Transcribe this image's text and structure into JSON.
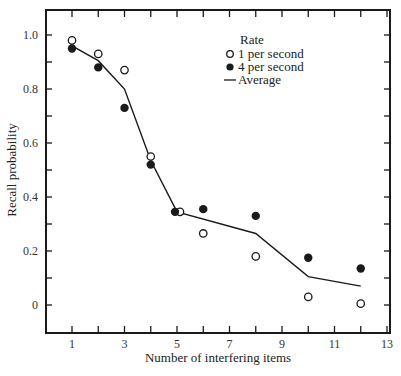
{
  "chart_data": {
    "type": "line",
    "title": "",
    "xlabel": "Number of interfering items",
    "ylabel": "Recall probability",
    "xlim": [
      0,
      13
    ],
    "ylim": [
      -0.1,
      1.1
    ],
    "x_ticks": [
      1,
      2,
      3,
      4,
      5,
      6,
      7,
      8,
      9,
      10,
      11,
      12,
      13
    ],
    "x_tick_labels": [
      "1",
      "3",
      "5",
      "7",
      "9",
      "11",
      "13"
    ],
    "x_tick_label_values": [
      1,
      3,
      5,
      7,
      9,
      11,
      13
    ],
    "y_ticks": [
      0,
      0.1,
      0.2,
      0.3,
      0.4,
      0.5,
      0.6,
      0.7,
      0.8,
      0.9,
      1.0
    ],
    "y_tick_labels": [
      "0",
      "0.2",
      "0.4",
      "0.6",
      "0.8",
      "1.0"
    ],
    "y_tick_label_values": [
      0,
      0.2,
      0.4,
      0.6,
      0.8,
      1.0
    ],
    "grid": false,
    "legend": {
      "title": "Rate",
      "position": "upper-right",
      "entries": [
        {
          "label": "1 per second",
          "marker": "open-circle"
        },
        {
          "label": "4 per second",
          "marker": "filled-circle"
        },
        {
          "label": "Average",
          "marker": "line"
        }
      ]
    },
    "series": [
      {
        "name": "1 per second",
        "style": "scatter-open-circle",
        "x": [
          1,
          2,
          3,
          4,
          5,
          6,
          8,
          10,
          12
        ],
        "values": [
          0.98,
          0.93,
          0.87,
          0.55,
          0.345,
          0.265,
          0.18,
          0.03,
          0.005
        ]
      },
      {
        "name": "4 per second",
        "style": "scatter-filled-circle",
        "x": [
          1,
          2,
          3,
          4,
          5,
          6,
          8,
          10,
          12
        ],
        "values": [
          0.95,
          0.88,
          0.73,
          0.52,
          0.345,
          0.355,
          0.33,
          0.175,
          0.135
        ]
      },
      {
        "name": "Average",
        "style": "line",
        "x": [
          1,
          2,
          3,
          4,
          5,
          8,
          10,
          12
        ],
        "values": [
          0.96,
          0.905,
          0.8,
          0.535,
          0.345,
          0.265,
          0.105,
          0.07
        ]
      }
    ]
  },
  "colors": {
    "axis": "#1a1a1a",
    "marker": "#1a1a1a",
    "background": "#ffffff"
  }
}
